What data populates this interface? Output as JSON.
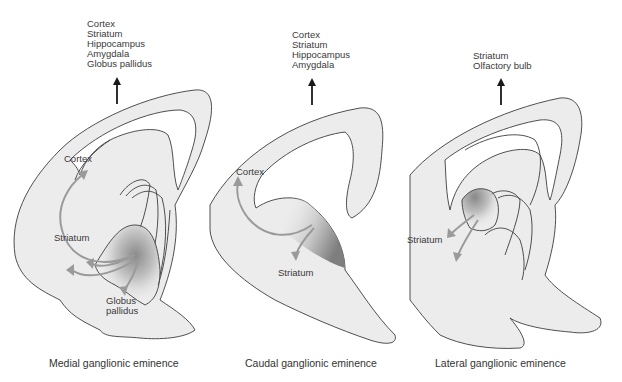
{
  "panels": [
    {
      "id": "medial",
      "caption": "Medial ganglionic eminence",
      "destinations": [
        "Cortex",
        "Striatum",
        "Hippocampus",
        "Amygdala",
        "Globus pallidus"
      ],
      "labels": {
        "cortex": "Cortex",
        "striatum": "Striatum",
        "globus1": "Globus",
        "globus2": "pallidus"
      }
    },
    {
      "id": "caudal",
      "caption": "Caudal ganglionic eminence",
      "destinations": [
        "Cortex",
        "Striatum",
        "Hippocampus",
        "Amygdala"
      ],
      "labels": {
        "cortex": "Cortex",
        "striatum": "Striatum"
      }
    },
    {
      "id": "lateral",
      "caption": "Lateral ganglionic eminence",
      "destinations": [
        "Striatum",
        "Olfactory bulb"
      ],
      "labels": {
        "striatum": "Striatum"
      }
    }
  ],
  "colors": {
    "tissue": "#ececec",
    "outline": "#3c3c3c",
    "migration_arrow": "#9a9a9a",
    "eminence_shade": "#8a8a8a",
    "up_arrow": "#1a1a1a"
  }
}
